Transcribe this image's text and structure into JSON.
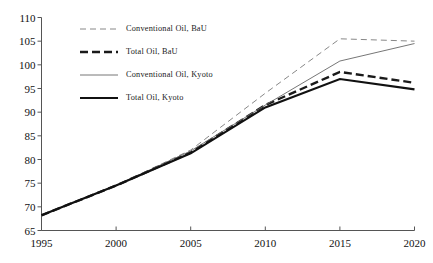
{
  "chart_data": {
    "type": "line",
    "title": "",
    "subtitle": "",
    "xlabel": "",
    "ylabel": "",
    "x": [
      1995,
      2000,
      2005,
      2010,
      2015,
      2020
    ],
    "xlim": [
      1995,
      2020
    ],
    "ylim": [
      65,
      110
    ],
    "xticks": [
      "1995",
      "2000",
      "2005",
      "2010",
      "2015",
      "2020"
    ],
    "yticks": [
      "65",
      "70",
      "75",
      "80",
      "85",
      "90",
      "95",
      "100",
      "105",
      "110"
    ],
    "ytick_values": [
      65,
      70,
      75,
      80,
      85,
      90,
      95,
      100,
      105,
      110
    ],
    "grid": false,
    "legend_position": "top-left-inside",
    "series": [
      {
        "name": "Conventional Oil, BaU",
        "values": [
          68.2,
          74.5,
          82.0,
          94.0,
          105.5,
          105.0
        ],
        "style": "dashed-thin",
        "color": "#888888",
        "width": 1.0,
        "dash": "6,4"
      },
      {
        "name": "Total Oil, BaU",
        "values": [
          68.2,
          74.5,
          81.5,
          91.5,
          98.5,
          96.2
        ],
        "style": "dashed-thick",
        "color": "#1a1a1a",
        "width": 2.4,
        "dash": "8,4"
      },
      {
        "name": "Conventional Oil, Kyoto",
        "values": [
          68.2,
          74.5,
          81.8,
          91.5,
          100.8,
          104.5
        ],
        "style": "solid-thin",
        "color": "#666666",
        "width": 0.9,
        "dash": "none"
      },
      {
        "name": "Total Oil, Kyoto",
        "values": [
          68.2,
          74.5,
          81.3,
          91.0,
          97.0,
          94.8
        ],
        "style": "solid-thick",
        "color": "#111111",
        "width": 2.2,
        "dash": "none"
      }
    ]
  },
  "legend": {
    "entries": [
      "Conventional Oil, BaU",
      "Total Oil, BaU",
      "Conventional Oil, Kyoto",
      "Total Oil, Kyoto"
    ]
  },
  "colors": {
    "axis": "#555555",
    "text": "#111111",
    "background": "#ffffff"
  }
}
